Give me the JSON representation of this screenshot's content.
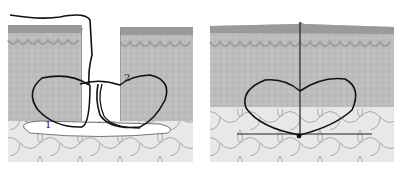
{
  "diagram": {
    "type": "surgical-suture-illustration",
    "panels": [
      {
        "id": "before",
        "description": "Open wound with suture loop passed through both wound edges",
        "labels": [
          {
            "text": "1",
            "x": 45,
            "y": 128
          },
          {
            "text": "2",
            "x": 124,
            "y": 78
          }
        ]
      },
      {
        "id": "after",
        "description": "Wound closed with heart-shaped suture loop tied below",
        "labels": []
      }
    ],
    "colors": {
      "epidermis": "#9a9a9a",
      "dermis": "#bdbdbd",
      "fat": "#e6e6e6",
      "fat_lines": "#a8a8a8",
      "suture": "#111111",
      "background": "#ffffff"
    }
  }
}
